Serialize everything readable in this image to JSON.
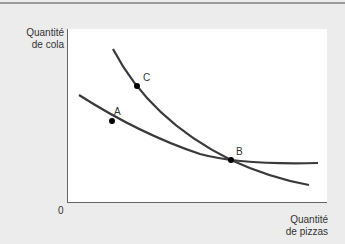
{
  "chart_data": {
    "type": "line",
    "title": "",
    "xlabel": "Quantité de pizzas",
    "ylabel": "Quantité de cola",
    "origin_label": "0",
    "grid": false,
    "legend": null,
    "series": [
      {
        "name": "Courbe plate (passant par A et B)",
        "description": "Indifference curve, flatter",
        "points_px": [
          [
            79,
            95
          ],
          [
            112,
            121
          ],
          [
            160,
            143
          ],
          [
            231,
            160
          ],
          [
            280,
            163
          ],
          [
            318,
            163
          ]
        ]
      },
      {
        "name": "Courbe raide (passant par C et B)",
        "description": "Indifference curve, steeper",
        "points_px": [
          [
            113,
            49
          ],
          [
            137,
            86
          ],
          [
            180,
            127
          ],
          [
            231,
            160
          ],
          [
            270,
            175
          ],
          [
            309,
            185
          ]
        ]
      }
    ],
    "points": [
      {
        "label": "A",
        "x": 112,
        "y": 121,
        "label_dx": 2,
        "label_dy": -6
      },
      {
        "label": "B",
        "x": 231,
        "y": 160,
        "label_dx": 5,
        "label_dy": -5
      },
      {
        "label": "C",
        "x": 137,
        "y": 86,
        "label_dx": 6,
        "label_dy": -5
      }
    ],
    "annotations": [
      "A",
      "B",
      "C"
    ]
  },
  "labels": {
    "y_axis_line1": "Quantité",
    "y_axis_line2": "de cola",
    "x_axis_line1": "Quantité",
    "x_axis_line2": "de pizzas",
    "origin": "0"
  },
  "colors": {
    "background": "#ececec",
    "plot_area": "#ffffff",
    "curve": "#3a3a3a",
    "axis": "#666666"
  }
}
